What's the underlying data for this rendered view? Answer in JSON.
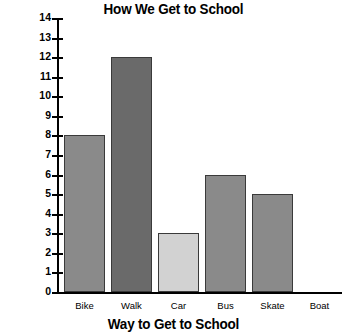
{
  "chart_data": {
    "type": "bar",
    "title": "How We Get to School",
    "xlabel": "Way to Get to School",
    "ylabel": "",
    "categories": [
      "Bike",
      "Walk",
      "Car",
      "Bus",
      "Skate",
      "Boat"
    ],
    "values": [
      8,
      12,
      3,
      6,
      5,
      0
    ],
    "bar_colors": [
      "#8a8a8a",
      "#6a6a6a",
      "#d2d2d2",
      "#8a8a8a",
      "#8a8a8a",
      "#8a8a8a"
    ],
    "bar_border_color": "#3a3a3a",
    "ylim": [
      0,
      14
    ],
    "ytick_labels": [
      "14",
      "13",
      "12",
      "11",
      "10",
      "9",
      "8",
      "7",
      "6",
      "5",
      "4",
      "3",
      "2",
      "1",
      "0"
    ],
    "ytick_values": [
      14,
      13,
      12,
      11,
      10,
      9,
      8,
      7,
      6,
      5,
      4,
      3,
      2,
      1,
      0
    ],
    "grid": false,
    "legend": false,
    "axis_color": "#000000"
  }
}
